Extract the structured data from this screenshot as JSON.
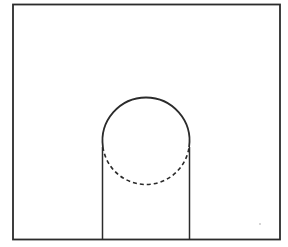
{
  "diagram": {
    "type": "basketball-free-throw-lane",
    "title": "",
    "colors": {
      "background": "#ffffff",
      "line": "#2b2b2b",
      "speck": "#c8c8c8"
    },
    "court_boundary": {
      "x1": 13,
      "y1": 4.5,
      "x2": 280,
      "y2": 239.5
    },
    "lane": {
      "left_x": 102.5,
      "right_x": 189.5,
      "top_y": 147,
      "bottom_y": 239.5
    },
    "free_throw_circle": {
      "cx": 146,
      "cy": 141,
      "r": 43.5,
      "upper_style": "solid",
      "lower_style": "dashed",
      "dash": "4 3"
    },
    "speck": {
      "cx": 260,
      "cy": 224,
      "r": 1
    }
  }
}
